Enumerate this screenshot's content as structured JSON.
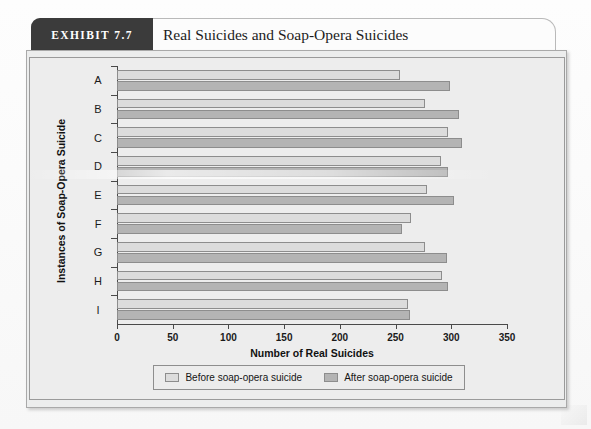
{
  "exhibit": {
    "tab_label": "EXHIBIT 7.7",
    "title": "Real Suicides and Soap-Opera Suicides"
  },
  "colors": {
    "before_bar": "#dcdcdc",
    "after_bar": "#b4b4b4",
    "tab_background": "#3b3b3b",
    "panel_background": "#ededed",
    "axis": "#4a4a4a"
  },
  "legend": {
    "items": [
      {
        "label": "Before soap-opera suicide",
        "swatch": "before"
      },
      {
        "label": "After soap-opera suicide",
        "swatch": "after"
      }
    ]
  },
  "chart_data": {
    "type": "bar",
    "orientation": "horizontal",
    "title": "Real Suicides and Soap-Opera Suicides",
    "xlabel": "Number of Real Suicides",
    "ylabel": "Instances of Soap-Opera Suicide",
    "categories": [
      "A",
      "B",
      "C",
      "D",
      "E",
      "F",
      "G",
      "H",
      "I"
    ],
    "series": [
      {
        "name": "Before soap-opera suicide",
        "values": [
          254,
          276,
          297,
          291,
          278,
          264,
          276,
          292,
          261
        ]
      },
      {
        "name": "After soap-opera suicide",
        "values": [
          299,
          307,
          310,
          297,
          302,
          256,
          296,
          297,
          263
        ]
      }
    ],
    "xlim": [
      0,
      350
    ],
    "xticks": [
      0,
      50,
      100,
      150,
      200,
      250,
      300,
      350
    ],
    "xtick_labels": [
      "0",
      "50",
      "100",
      "150",
      "200",
      "250",
      "300",
      "350"
    ],
    "grid": false,
    "legend_position": "bottom"
  }
}
